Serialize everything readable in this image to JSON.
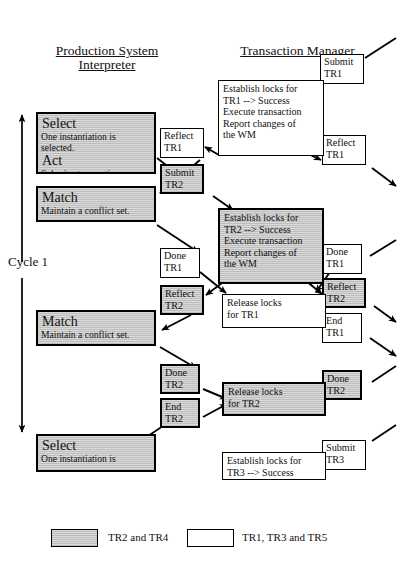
{
  "headers": {
    "left": "Production System\nInterpreter",
    "right": "Transaction Manager"
  },
  "cycle": {
    "label": "Cycle 1"
  },
  "interpreter_boxes": [
    {
      "id": "select-1",
      "title": "Select",
      "line1": "One instantiation is",
      "line2": "selected.",
      "title2": "Act",
      "line3": "Submit a transaction.",
      "shaded": true
    },
    {
      "id": "match-1",
      "title": "Match",
      "line1": "Maintain a conflict set.",
      "shaded": true
    },
    {
      "id": "match-2",
      "title": "Match",
      "line1": "Maintain a conflict set.",
      "shaded": true
    },
    {
      "id": "select-2",
      "title": "Select",
      "line1": "One instantiation is",
      "shaded": true
    }
  ],
  "message_boxes": [
    {
      "id": "msg-reflect-tr1-mid",
      "line1": "Reflect",
      "line2": "TR1",
      "shaded": false
    },
    {
      "id": "msg-submit-tr2-mid",
      "line1": "Submit",
      "line2": "TR2",
      "shaded": true
    },
    {
      "id": "msg-done-tr1-mid",
      "line1": "Done",
      "line2": "TR1",
      "shaded": false
    },
    {
      "id": "msg-reflect-tr2-mid",
      "line1": "Reflect",
      "line2": "TR2",
      "shaded": true
    },
    {
      "id": "msg-done-tr2-mid",
      "line1": "Done",
      "line2": "TR2",
      "shaded": true
    },
    {
      "id": "msg-end-tr2-mid",
      "line1": "End",
      "line2": "TR2",
      "shaded": true
    },
    {
      "id": "msg-submit-tr1-right",
      "line1": "Submit",
      "line2": "TR1",
      "shaded": false
    },
    {
      "id": "msg-reflect-tr1-right",
      "line1": "Reflect",
      "line2": "TR1",
      "shaded": false
    },
    {
      "id": "msg-done-tr1-right",
      "line1": "Done",
      "line2": "TR1",
      "shaded": false
    },
    {
      "id": "msg-reflect-tr2-right",
      "line1": "Reflect",
      "line2": "TR2",
      "shaded": true
    },
    {
      "id": "msg-end-tr1-right",
      "line1": "End",
      "line2": "TR1",
      "shaded": false
    },
    {
      "id": "msg-done-tr2-right",
      "line1": "Done",
      "line2": "TR2",
      "shaded": true
    },
    {
      "id": "msg-submit-tr3-right",
      "line1": "Submit",
      "line2": "TR3",
      "shaded": false
    }
  ],
  "tm_boxes": [
    {
      "id": "tm-establish-tr1",
      "line1": "Establish locks for",
      "line2": "TR1 --> Success",
      "line3": "Execute transaction",
      "line4": "Report changes of",
      "line5": "the WM",
      "shaded": false
    },
    {
      "id": "tm-establish-tr2",
      "line1": "Establish locks for",
      "line2": "TR2 --> Success",
      "line3": "Execute transaction",
      "line4": "Report changes of",
      "line5": "the WM",
      "shaded": true
    },
    {
      "id": "tm-release-tr1",
      "line1": "Release locks",
      "line2": "for TR1",
      "shaded": false
    },
    {
      "id": "tm-release-tr2",
      "line1": "Release locks",
      "line2": "for TR2",
      "shaded": true
    },
    {
      "id": "tm-establish-tr3",
      "line1": "Establish locks for",
      "line2": "TR3 --> Success",
      "shaded": false
    }
  ],
  "legend": {
    "shaded_label": "TR2 and TR4",
    "plain_label": "TR1, TR3 and TR5"
  },
  "colors": {
    "stroke": "#000000",
    "shaded_fill": "#d9d9d9",
    "plain_fill": "#ffffff",
    "background": "#ffffff"
  }
}
